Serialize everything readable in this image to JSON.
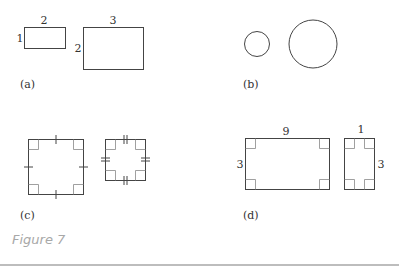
{
  "figure": {
    "caption": "Figure 7",
    "panels": {
      "a": {
        "label": "(a)",
        "shapes": [
          {
            "type": "rectangle",
            "width_label": "2",
            "height_label": "1"
          },
          {
            "type": "rectangle",
            "width_label": "3",
            "height_label": "2"
          }
        ]
      },
      "b": {
        "label": "(b)",
        "shapes": [
          {
            "type": "circle",
            "size": "small"
          },
          {
            "type": "circle",
            "size": "large"
          }
        ]
      },
      "c": {
        "label": "(c)",
        "shapes": [
          {
            "type": "square",
            "tick_marks": "single",
            "right_angles": 4
          },
          {
            "type": "square",
            "tick_marks": "double",
            "right_angles": 4
          }
        ]
      },
      "d": {
        "label": "(d)",
        "shapes": [
          {
            "type": "rectangle",
            "width_label": "9",
            "height_label": "3",
            "right_angles": 4
          },
          {
            "type": "rectangle",
            "width_label": "1",
            "height_label": "3",
            "right_angles": 4
          }
        ]
      }
    }
  },
  "colors": {
    "stroke": "#444444",
    "angle_mark": "#888888",
    "caption": "#a8a8a8"
  }
}
